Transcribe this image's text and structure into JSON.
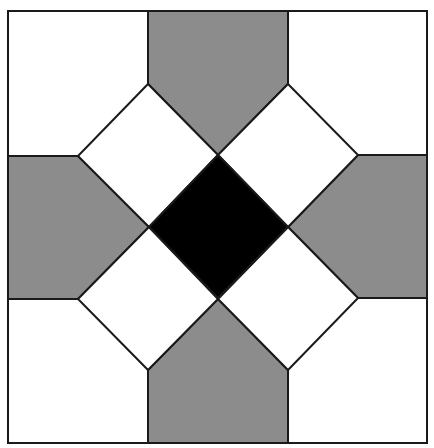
{
  "diagram": {
    "title": "",
    "colors": {
      "background": "#ffffff",
      "gray": "#8c8c8c",
      "black": "#000000",
      "stroke": "#1a1a1a"
    },
    "shapes": [
      {
        "id": "corner-top-left",
        "fill": "white"
      },
      {
        "id": "corner-top-right",
        "fill": "white"
      },
      {
        "id": "corner-bottom-left",
        "fill": "white"
      },
      {
        "id": "corner-bottom-right",
        "fill": "white"
      },
      {
        "id": "pentagon-top",
        "fill": "gray"
      },
      {
        "id": "pentagon-right",
        "fill": "gray"
      },
      {
        "id": "pentagon-bottom",
        "fill": "gray"
      },
      {
        "id": "pentagon-left",
        "fill": "gray"
      },
      {
        "id": "diamond-top-left",
        "fill": "white"
      },
      {
        "id": "diamond-top-right",
        "fill": "white"
      },
      {
        "id": "diamond-bottom-left",
        "fill": "white"
      },
      {
        "id": "diamond-bottom-right",
        "fill": "white"
      },
      {
        "id": "center-diamond",
        "fill": "black"
      }
    ]
  }
}
